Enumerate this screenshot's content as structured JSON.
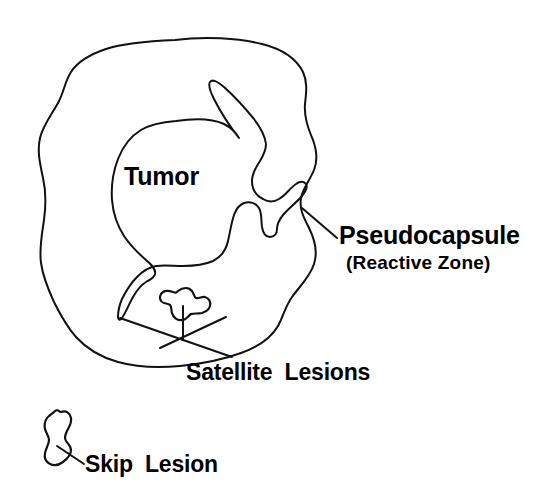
{
  "figure": {
    "kind": "medical-line-diagram",
    "background_color": "#ffffff",
    "stroke_color": "#111111",
    "text_color": "#000000"
  },
  "labels": {
    "tumor": "Tumor",
    "pseudocapsule": "Pseudocapsule",
    "reactive_zone": "(Reactive Zone)",
    "satellite_lesions": "Satellite Lesions",
    "skip_lesion": "Skip Lesion"
  },
  "structures": [
    {
      "name": "pseudocapsule-outline",
      "label": "Pseudocapsule",
      "description": "Large irregular outer boundary enclosing the tumor and satellite lesions"
    },
    {
      "name": "tumor-outline",
      "label": "Tumor",
      "description": "Inner irregular mass with an upward spike and a forked finger-like projection to the right"
    },
    {
      "name": "satellite-lesion",
      "label": "Satellite Lesions",
      "description": "Small lobed nodule inside the pseudocapsule, separate from the main tumor"
    },
    {
      "name": "skip-lesion",
      "label": "Skip Lesion",
      "description": "Elongated irregular nodule located outside and below the pseudocapsule"
    }
  ],
  "leader_lines": [
    {
      "name": "pseudocapsule-leader",
      "from": "pseudocapsule outline",
      "to": "Pseudocapsule"
    },
    {
      "name": "tumor-tail-leader",
      "from": "tumor lower-left tail",
      "to": "Satellite Lesions"
    },
    {
      "name": "satellite-leader",
      "from": "satellite lesion",
      "to": "Satellite Lesions"
    },
    {
      "name": "skip-leader",
      "from": "skip lesion",
      "to": "Skip Lesion"
    }
  ]
}
